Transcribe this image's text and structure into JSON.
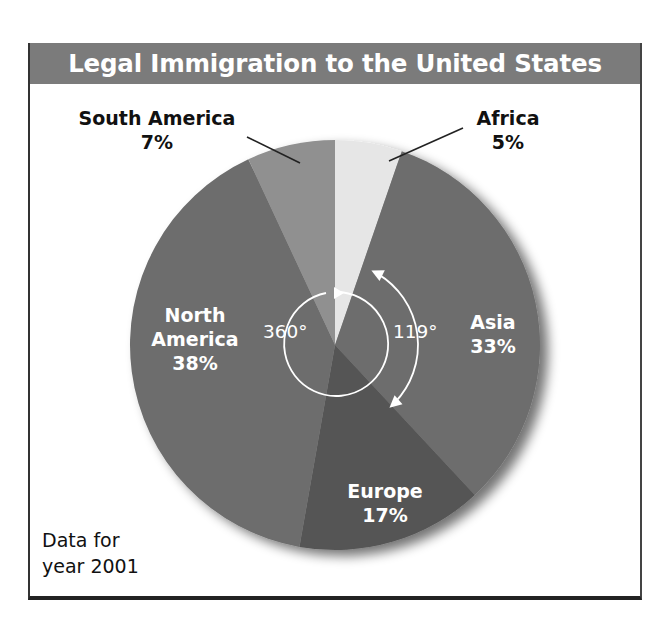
{
  "title": "Legal Immigration to the United States",
  "note": [
    "Data for",
    "year 2001"
  ],
  "angle_labels": {
    "full_circle": "360°",
    "asia_arc": "119°"
  },
  "colors": {
    "header": "#7b7b7b",
    "africa": "#e6e6e6",
    "asia": "#6d6d6d",
    "europe": "#555555",
    "north_america": "#6d6d6d",
    "south_america": "#909090"
  },
  "slices": [
    {
      "name": "Africa",
      "pct": "5%"
    },
    {
      "name": "Asia",
      "pct": "33%"
    },
    {
      "name": "Europe",
      "pct": "17%"
    },
    {
      "name": "North America",
      "name_lines": [
        "North",
        "America"
      ],
      "pct": "38%"
    },
    {
      "name": "South America",
      "pct": "7%"
    }
  ],
  "chart_data": {
    "type": "pie",
    "title": "Legal Immigration to the United States",
    "subtitle": "Data for year 2001",
    "categories": [
      "Africa",
      "Asia",
      "Europe",
      "North America",
      "South America"
    ],
    "values": [
      5,
      33,
      17,
      38,
      7
    ],
    "unit": "%",
    "annotations": [
      {
        "text": "360°",
        "description": "full-circle arrow around center"
      },
      {
        "text": "119°",
        "description": "arc spanning the Asia slice (33% of 360°)"
      }
    ],
    "legend": "none (direct labels)"
  }
}
